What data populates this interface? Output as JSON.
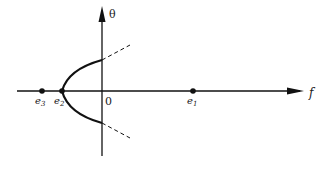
{
  "diagram": {
    "axes": {
      "horizontal_label": "f",
      "vertical_label": "θ",
      "origin_label": "0"
    },
    "points": [
      {
        "id": "e3",
        "label": "e",
        "subscript": "3"
      },
      {
        "id": "e2",
        "label": "e",
        "subscript": "2"
      },
      {
        "id": "e1",
        "label": "e",
        "subscript": "1"
      }
    ],
    "curve": {
      "type": "parabola-opening-right",
      "vertex": "e2",
      "solid_until": "vertical-axis",
      "continuation": "dashed"
    },
    "colors": {
      "ink": "#111111",
      "background": "#ffffff"
    }
  }
}
